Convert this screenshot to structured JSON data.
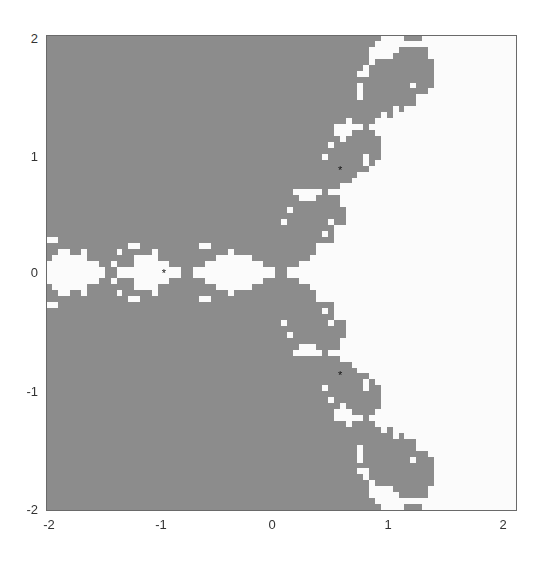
{
  "chart_data": {
    "type": "heatmap",
    "title": "",
    "subtitle": "",
    "xlabel": "",
    "ylabel": "",
    "xlim": [
      -2,
      2
    ],
    "ylim": [
      -2,
      2
    ],
    "grid": false,
    "legend": null,
    "x_ticks": [
      "-2",
      "-1",
      "0",
      "1",
      "2"
    ],
    "y_ticks": [
      "2",
      "1",
      "0",
      "-1",
      "-2"
    ],
    "resolution": [
      80,
      80
    ],
    "regions": [
      {
        "name": "basin of root 1 (upper right, 0.5 + 0.87i)",
        "root": [
          0.5,
          0.866
        ],
        "color": "#fbfbfb"
      },
      {
        "name": "basin of root -1",
        "root": [
          -1,
          0
        ],
        "color": "#8c8c8c"
      },
      {
        "name": "basin of root 0.5 - 0.87i",
        "root": [
          0.5,
          -0.866
        ],
        "color": "#5c5c5c"
      }
    ],
    "markers": [
      {
        "x": -1,
        "y": 0,
        "symbol": "*"
      },
      {
        "x": 0.5,
        "y": 0.866,
        "symbol": "*"
      },
      {
        "x": 0.5,
        "y": -0.866,
        "symbol": "*"
      }
    ],
    "iteration": "z_{n+1} = z_n - (z_n^3 - 1)/(3 z_n^2)"
  }
}
